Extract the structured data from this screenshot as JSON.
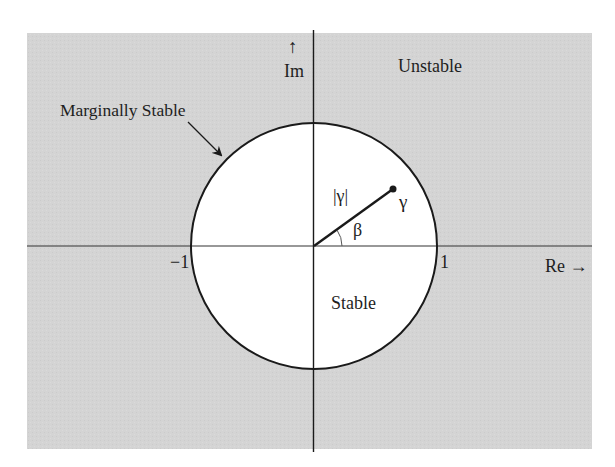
{
  "diagram": {
    "type": "unit-circle-stability",
    "colors": {
      "outside_region": "#d4d4d4",
      "inside_region": "#ffffff",
      "stroke": "#1a1a1a",
      "page_background": "#ffffff"
    },
    "axes": {
      "im_arrow": "↑",
      "im_label": "Im",
      "re_label": "Re →"
    },
    "ticks": {
      "neg_one": "−1",
      "pos_one": "1"
    },
    "regions": {
      "unstable": "Unstable",
      "stable": "Stable",
      "marginal": "Marginally Stable"
    },
    "vector": {
      "magnitude_label": "|γ|",
      "point_label": "γ",
      "angle_label": "β"
    }
  }
}
